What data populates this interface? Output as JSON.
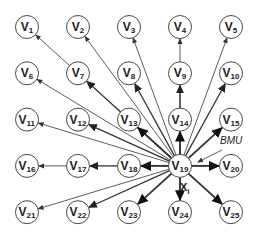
{
  "diagram": {
    "grid": {
      "cols": 5,
      "rows": 5,
      "x0": 27,
      "y0": 27,
      "dx": 51,
      "dy": 46.3,
      "radius": 11.5
    },
    "bmu_index": 19,
    "nodes": [
      {
        "id": 1,
        "label": "V",
        "sub": "1"
      },
      {
        "id": 2,
        "label": "V",
        "sub": "2"
      },
      {
        "id": 3,
        "label": "V",
        "sub": "3"
      },
      {
        "id": 4,
        "label": "V",
        "sub": "4"
      },
      {
        "id": 5,
        "label": "V",
        "sub": "5"
      },
      {
        "id": 6,
        "label": "V",
        "sub": "6"
      },
      {
        "id": 7,
        "label": "V",
        "sub": "7"
      },
      {
        "id": 8,
        "label": "V",
        "sub": "8"
      },
      {
        "id": 9,
        "label": "V",
        "sub": "9"
      },
      {
        "id": 10,
        "label": "V",
        "sub": "10"
      },
      {
        "id": 11,
        "label": "V",
        "sub": "11"
      },
      {
        "id": 12,
        "label": "V",
        "sub": "12"
      },
      {
        "id": 13,
        "label": "V",
        "sub": "13"
      },
      {
        "id": 14,
        "label": "V",
        "sub": "14"
      },
      {
        "id": 15,
        "label": "V",
        "sub": "15"
      },
      {
        "id": 16,
        "label": "V",
        "sub": "16"
      },
      {
        "id": 17,
        "label": "V",
        "sub": "17"
      },
      {
        "id": 18,
        "label": "V",
        "sub": "18"
      },
      {
        "id": 19,
        "label": "V",
        "sub": "19"
      },
      {
        "id": 20,
        "label": "V",
        "sub": "20"
      },
      {
        "id": 21,
        "label": "V",
        "sub": "21"
      },
      {
        "id": 22,
        "label": "V",
        "sub": "22"
      },
      {
        "id": 23,
        "label": "V",
        "sub": "23"
      },
      {
        "id": 24,
        "label": "V",
        "sub": "24"
      },
      {
        "id": 25,
        "label": "V",
        "sub": "25"
      }
    ],
    "edges": [
      {
        "from": 19,
        "to": 1,
        "weight": "thin"
      },
      {
        "from": 19,
        "to": 2,
        "weight": "thin"
      },
      {
        "from": 19,
        "to": 3,
        "weight": "thin"
      },
      {
        "from": 14,
        "to": 4,
        "weight": "thin"
      },
      {
        "from": 19,
        "to": 5,
        "weight": "thin"
      },
      {
        "from": 19,
        "to": 6,
        "weight": "thin"
      },
      {
        "from": 19,
        "to": 7,
        "weight": "medium"
      },
      {
        "from": 19,
        "to": 8,
        "weight": "medium"
      },
      {
        "from": 14,
        "to": 9,
        "weight": "medium"
      },
      {
        "from": 19,
        "to": 10,
        "weight": "medium"
      },
      {
        "from": 19,
        "to": 11,
        "weight": "thin"
      },
      {
        "from": 19,
        "to": 12,
        "weight": "medium"
      },
      {
        "from": 19,
        "to": 13,
        "weight": "bold"
      },
      {
        "from": 19,
        "to": 14,
        "weight": "bold"
      },
      {
        "from": 19,
        "to": 15,
        "weight": "bold"
      },
      {
        "from": 17,
        "to": 16,
        "weight": "thin"
      },
      {
        "from": 18,
        "to": 17,
        "weight": "medium"
      },
      {
        "from": 19,
        "to": 18,
        "weight": "bold"
      },
      {
        "from": 19,
        "to": 20,
        "weight": "bold"
      },
      {
        "from": 19,
        "to": 21,
        "weight": "thin"
      },
      {
        "from": 19,
        "to": 22,
        "weight": "medium"
      },
      {
        "from": 19,
        "to": 23,
        "weight": "bold"
      },
      {
        "from": 19,
        "to": 24,
        "weight": "bold"
      },
      {
        "from": 19,
        "to": 25,
        "weight": "bold"
      }
    ],
    "annotations": {
      "bmu_label": "BMU",
      "input_label": "X",
      "input_sub": "i"
    },
    "colors": {
      "stroke": "#333333",
      "fill": "#ffffff",
      "text": "#222222"
    }
  }
}
